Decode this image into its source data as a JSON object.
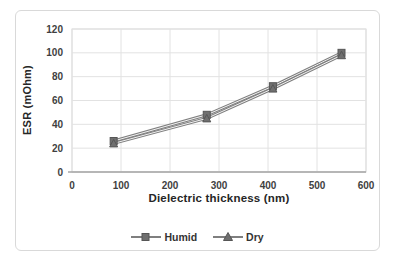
{
  "chart_data": {
    "type": "line",
    "xlabel": "Dielectric thickness (nm)",
    "ylabel": "ESR (mOhm)",
    "x": [
      85,
      275,
      410,
      550
    ],
    "series": [
      {
        "name": "Humid",
        "marker": "square",
        "values": [
          26,
          48,
          72,
          100
        ]
      },
      {
        "name": "Dry",
        "marker": "triangle",
        "values": [
          24,
          45,
          70,
          98
        ]
      }
    ],
    "xlim": [
      0,
      600
    ],
    "ylim": [
      0,
      120
    ],
    "x_ticks": [
      0,
      100,
      200,
      300,
      400,
      500,
      600
    ],
    "y_ticks": [
      0,
      20,
      40,
      60,
      80,
      100,
      120
    ],
    "grid": true,
    "legend_position": "bottom",
    "colors": {
      "series_line": "#7f7f7f",
      "series_line_core": "#f2f2f2",
      "marker_fill": "#6f6f6f",
      "marker_stroke": "#565656",
      "gridline": "#e2e2e2",
      "plot_border": "#d9d9d9",
      "axis_line": "#a6a6a6",
      "tick_text": "#3f3f3f"
    }
  }
}
